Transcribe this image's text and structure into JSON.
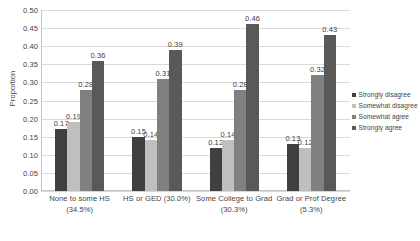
{
  "chart_data": {
    "type": "bar",
    "title": "",
    "subtitle": "",
    "xlabel": "",
    "ylabel": "Proportion",
    "ylim": [
      0,
      0.5
    ],
    "ytick_step": 0.05,
    "ytick_labels": [
      "0.50",
      "0.45",
      "0.40",
      "0.35",
      "0.30",
      "0.25",
      "0.20",
      "0.15",
      "0.10",
      "0.05",
      "0.00"
    ],
    "grid": true,
    "legend_position": "right",
    "categories": [
      "None to some HS (34.5%)",
      "HS or GED (30.0%)",
      "Some College to Grad (30.3%)",
      "Grad or Prof Degree (5.3%)"
    ],
    "category_lines": [
      {
        "line1": "None to some HS",
        "line2": "(34.5%)"
      },
      {
        "line1": "HS or GED (30.0%)",
        "line2": ""
      },
      {
        "line1": "Some College to Grad",
        "line2": "(30.3%)"
      },
      {
        "line1": "Grad or Prof Degree",
        "line2": "(5.3%)"
      }
    ],
    "series": [
      {
        "name": "Strongly disagree",
        "color": "#404040",
        "values": [
          0.17,
          0.15,
          0.12,
          0.13
        ],
        "labels": [
          "0.17",
          "0.15",
          "0.12",
          "0.13"
        ]
      },
      {
        "name": "Somewhat disagree",
        "color": "#bfbfbf",
        "values": [
          0.19,
          0.14,
          0.14,
          0.12
        ],
        "labels": [
          "0.19",
          "0.14",
          "0.14",
          "0.12"
        ]
      },
      {
        "name": "Somewhat agree",
        "color": "#808080",
        "values": [
          0.28,
          0.31,
          0.28,
          0.32
        ],
        "labels": [
          "0.28",
          "0.31",
          "0.28",
          "0.32"
        ]
      },
      {
        "name": "Strongly agree",
        "color": "#595959",
        "values": [
          0.36,
          0.39,
          0.46,
          0.43
        ],
        "labels": [
          "0.36",
          "0.39",
          "0.46",
          "0.43"
        ]
      }
    ]
  },
  "legend": {
    "items": [
      {
        "label": "Strongly disagree",
        "color": "#404040"
      },
      {
        "label": "Somewhat disagree",
        "color": "#bfbfbf"
      },
      {
        "label": "Somewhat agree",
        "color": "#808080"
      },
      {
        "label": "Strongly agree",
        "color": "#595959"
      }
    ]
  },
  "colors": {
    "grid": "#d9d9d9",
    "axis": "#c4c4c4",
    "text": "#3f3f3f",
    "background": "#ffffff"
  }
}
